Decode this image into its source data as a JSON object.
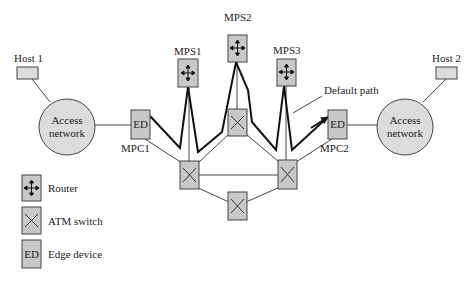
{
  "diagram": {
    "colors": {
      "box_fill": "#c8c8c8",
      "circle_fill": "#dcdcdc",
      "stroke": "#444444",
      "line": "#333333"
    },
    "hosts": [
      {
        "id": "host1",
        "label": "Host 1"
      },
      {
        "id": "host2",
        "label": "Host 2"
      }
    ],
    "access_networks": [
      {
        "id": "access-left",
        "label_line1": "Access",
        "label_line2": "network"
      },
      {
        "id": "access-right",
        "label_line1": "Access",
        "label_line2": "network"
      }
    ],
    "edge_devices": [
      {
        "id": "mpc1",
        "box_text": "ED",
        "label": "MPC1"
      },
      {
        "id": "mpc2",
        "box_text": "ED",
        "label": "MPC2"
      }
    ],
    "routers": [
      {
        "id": "mps1",
        "label": "MPS1",
        "icon": "router-icon"
      },
      {
        "id": "mps2",
        "label": "MPS2",
        "icon": "router-icon"
      },
      {
        "id": "mps3",
        "label": "MPS3",
        "icon": "router-icon"
      }
    ],
    "atm_switches": [
      {
        "id": "atm-top",
        "icon": "atm-switch-icon"
      },
      {
        "id": "atm-left",
        "icon": "atm-switch-icon"
      },
      {
        "id": "atm-right",
        "icon": "atm-switch-icon"
      },
      {
        "id": "atm-bottom",
        "icon": "atm-switch-icon"
      }
    ],
    "annotation": {
      "default_path": "Default path"
    },
    "legend": [
      {
        "icon": "router-icon",
        "label": "Router"
      },
      {
        "icon": "atm-switch-icon",
        "label": "ATM switch"
      },
      {
        "icon": "edge-device-icon",
        "box_text": "ED",
        "label": "Edge device"
      }
    ]
  }
}
